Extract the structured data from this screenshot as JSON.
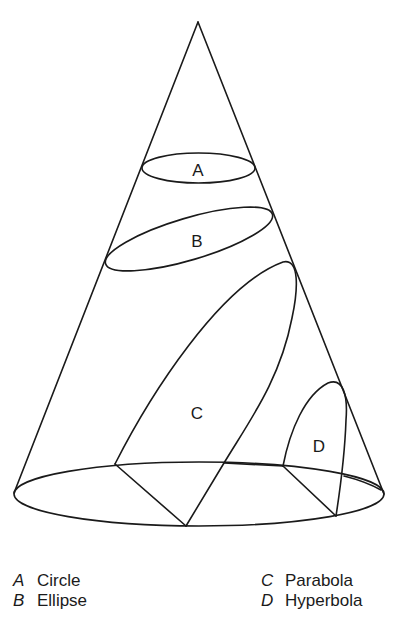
{
  "figure": {
    "title": "",
    "regions": [
      {
        "key": "A",
        "label": "A",
        "x": 198,
        "y": 170
      },
      {
        "key": "B",
        "label": "B",
        "x": 197,
        "y": 241
      },
      {
        "key": "C",
        "label": "C",
        "x": 197,
        "y": 413
      },
      {
        "key": "D",
        "label": "D",
        "x": 319,
        "y": 446
      }
    ],
    "colors": {
      "stroke": "#1a1a1a",
      "background": "#ffffff"
    }
  },
  "legend": {
    "left": [
      {
        "key": "A",
        "name": "Circle"
      },
      {
        "key": "B",
        "name": "Ellipse"
      }
    ],
    "right": [
      {
        "key": "C",
        "name": "Parabola"
      },
      {
        "key": "D",
        "name": "Hyperbola"
      }
    ]
  }
}
